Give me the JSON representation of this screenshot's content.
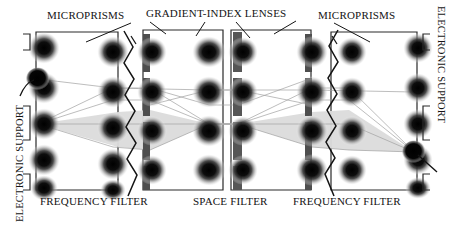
{
  "figure": {
    "labels": {
      "microprisms_left": "MICROPRISMS",
      "gradient_index_lenses": "GRADIENT-INDEX LENSES",
      "microprisms_right": "MICROPRISMS",
      "frequency_filter_left": "FREQUENCY FILTER",
      "space_filter": "SPACE FILTER",
      "frequency_filter_right": "FREQUENCY FILTER",
      "electronic_support_left": "ELECTRONIC SUPPORT",
      "electronic_support_right": "ELECTRONIC SUPPORT"
    },
    "colors": {
      "ink": "#141414",
      "blob_core": "#101010",
      "blob_halo": "#b9b9b9",
      "bar_dark": "#4a4a4a",
      "beam_fill": "#d9d9d9",
      "ray_line": "#9a9a9a",
      "frame": "#2a2a2a",
      "background": "#ffffff"
    },
    "panels": [
      {
        "name": "panel-1",
        "x": 36,
        "y": 32,
        "w": 82,
        "h": 158
      },
      {
        "name": "panel-2",
        "x": 143,
        "y": 30,
        "w": 80,
        "h": 160
      },
      {
        "name": "panel-3",
        "x": 231,
        "y": 30,
        "w": 80,
        "h": 160
      },
      {
        "name": "panel-4",
        "x": 331,
        "y": 32,
        "w": 86,
        "h": 158
      }
    ],
    "blob_columns": [
      {
        "name": "column-input",
        "cx": 44,
        "count": 5
      },
      {
        "name": "column-prism-left",
        "cx": 113,
        "count": 5
      },
      {
        "name": "column-filter-left",
        "cx": 150,
        "count": 4
      },
      {
        "name": "column-lens-center",
        "cx": 209,
        "count": 4
      },
      {
        "name": "column-space-filter",
        "cx": 238,
        "count": 4
      },
      {
        "name": "column-filter-right",
        "cx": 312,
        "count": 4
      },
      {
        "name": "column-prism-right",
        "cx": 349,
        "count": 4
      },
      {
        "name": "column-output",
        "cx": 418,
        "count": 5
      }
    ],
    "blob_rows_y": [
      48,
      88,
      124,
      160,
      186
    ],
    "vertical_bars": [
      {
        "name": "frequency-filter-bar-left",
        "x": 143,
        "width": 7
      },
      {
        "name": "space-filter-bar",
        "x": 233,
        "width": 9
      },
      {
        "name": "frequency-filter-bar-right",
        "x": 305,
        "width": 7
      }
    ],
    "source_spot": {
      "name": "input-source-spot",
      "cx": 37,
      "cy": 79,
      "r": 11
    },
    "output_spot": {
      "name": "output-detector-spot",
      "cx": 415,
      "cy": 152,
      "r": 11
    },
    "microprisms": [
      {
        "name": "microprism-zigzag-left",
        "x": 128
      },
      {
        "name": "microprism-zigzag-right",
        "x": 330
      }
    ],
    "brackets_left_y": [
      36,
      112,
      178
    ],
    "brackets_right_y": [
      34,
      108,
      176
    ]
  }
}
